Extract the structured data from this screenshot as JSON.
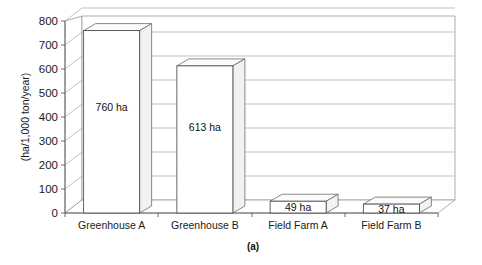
{
  "chart_data": {
    "type": "bar",
    "title": "",
    "subtitle": "",
    "caption": "(a)",
    "xlabel": "",
    "ylabel": "(ha/1,000 ton/year)",
    "categories": [
      "Greenhouse A",
      "Greenhouse B",
      "Field Farm A",
      "Field Farm B"
    ],
    "values": [
      760,
      613,
      49,
      37
    ],
    "data_labels": [
      "760 ha",
      "613 ha",
      "49 ha",
      "37 ha"
    ],
    "ylim": [
      0,
      800
    ],
    "ytick_values": [
      0,
      100,
      200,
      300,
      400,
      500,
      600,
      700,
      800
    ],
    "ytick_labels": [
      "0",
      "100",
      "200",
      "300",
      "400",
      "500",
      "600",
      "700",
      "800"
    ],
    "grid": true,
    "grid_axis": "y",
    "legend": null,
    "legend_position": "none",
    "style": "3d-column",
    "units": "ha",
    "colors": {
      "bar_face": "#ffffff",
      "bar_outline": "#4a4a4a",
      "grid": "#a8a8a8",
      "axis": "#5a5a5a",
      "text": "#1a1a1a",
      "background": "#ffffff"
    }
  },
  "figure": {
    "caption_label": "(a)",
    "axis_title_y": "(ha/1,000 ton/year)"
  },
  "axis": {
    "ticks": [
      {
        "label": "800",
        "value": 800
      },
      {
        "label": "700",
        "value": 700
      },
      {
        "label": "600",
        "value": 600
      },
      {
        "label": "500",
        "value": 500
      },
      {
        "label": "400",
        "value": 400
      },
      {
        "label": "300",
        "value": 300
      },
      {
        "label": "200",
        "value": 200
      },
      {
        "label": "100",
        "value": 100
      },
      {
        "label": "0",
        "value": 0
      }
    ]
  },
  "series": [
    {
      "category": "Greenhouse A",
      "value": 760,
      "label": "760 ha"
    },
    {
      "category": "Greenhouse B",
      "value": 613,
      "label": "613 ha"
    },
    {
      "category": "Field Farm A",
      "value": 49,
      "label": "49 ha"
    },
    {
      "category": "Field Farm B",
      "value": 37,
      "label": "37 ha"
    }
  ]
}
